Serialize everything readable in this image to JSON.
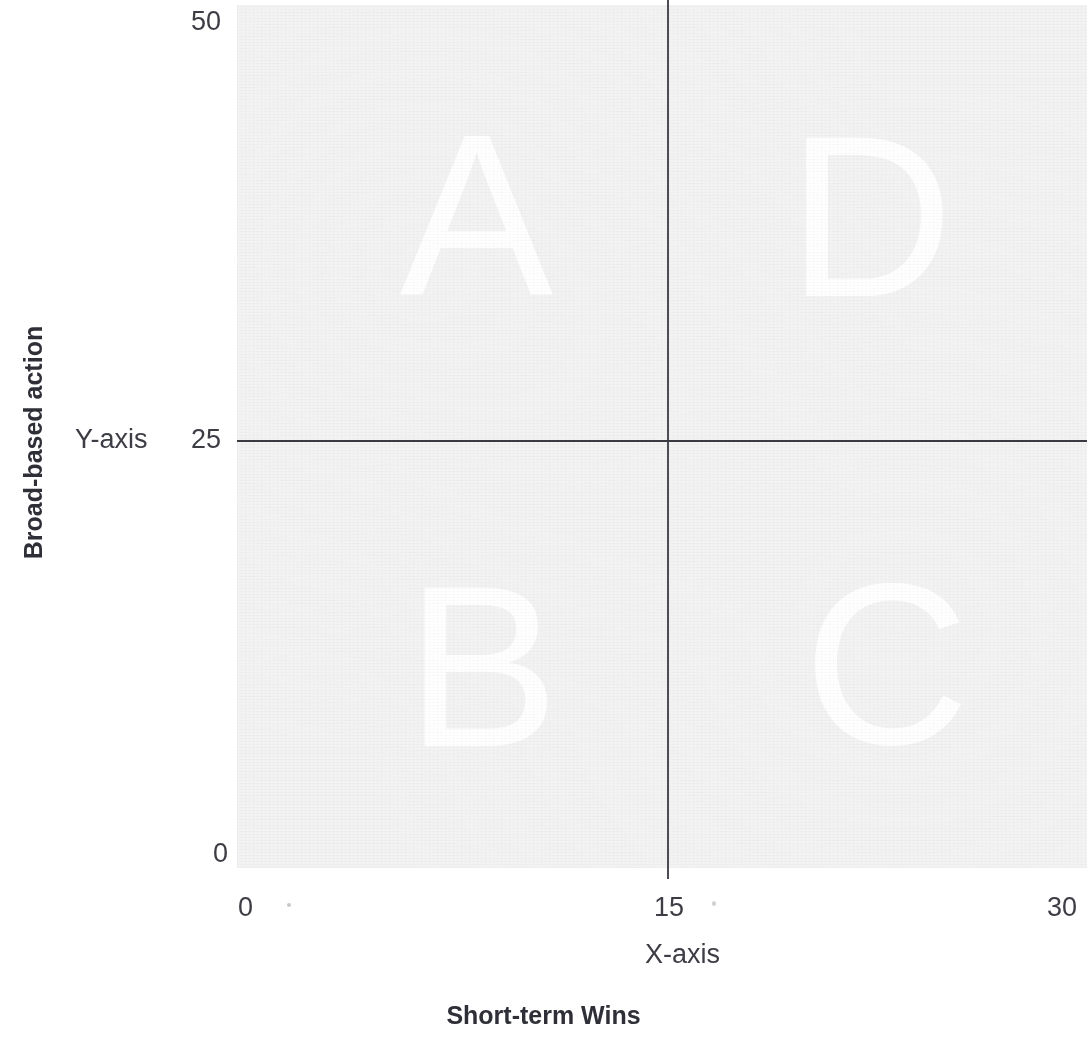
{
  "chart_data": {
    "type": "scatter",
    "title": "",
    "subtitle": "",
    "xlabel": "X-axis",
    "ylabel": "Y-axis",
    "x_outer_title": "Short-term Wins",
    "y_outer_title": "Broad-based action",
    "xlim": [
      0,
      30
    ],
    "ylim": [
      0,
      50
    ],
    "x_ticks": [
      "0",
      "15",
      "30"
    ],
    "y_ticks": [
      "0",
      "25",
      "50"
    ],
    "x_tick_values": [
      0,
      15,
      30
    ],
    "y_tick_values": [
      0,
      25,
      50
    ],
    "grid": false,
    "legend": null,
    "divider_x": 15,
    "divider_y": 25,
    "series": [],
    "quadrants": [
      {
        "id": "A",
        "label": "A",
        "x_range": [
          0,
          15
        ],
        "y_range": [
          25,
          50
        ],
        "position": "top-left"
      },
      {
        "id": "D",
        "label": "D",
        "x_range": [
          15,
          30
        ],
        "y_range": [
          25,
          50
        ],
        "position": "top-right"
      },
      {
        "id": "B",
        "label": "B",
        "x_range": [
          0,
          15
        ],
        "y_range": [
          0,
          25
        ],
        "position": "bottom-left"
      },
      {
        "id": "C",
        "label": "C",
        "x_range": [
          15,
          30
        ],
        "y_range": [
          0,
          25
        ],
        "position": "bottom-right"
      }
    ],
    "annotations": [],
    "colors": {
      "panel": "#f3f3f4",
      "axis_line": "#3a3a42",
      "divider_line": "#4c4c55",
      "quadrant_letter": "#ffffff",
      "text": "#3d3d46",
      "title_text": "#2f2f38",
      "background": "#ffffff"
    }
  },
  "axes": {
    "y": {
      "name": "Y-axis",
      "outer_title": "Broad-based action",
      "ticks": {
        "top": "50",
        "middle": "25",
        "bottom": "0"
      }
    },
    "x": {
      "name": "X-axis",
      "outer_title": "Short-term Wins",
      "ticks": {
        "left": "0",
        "middle": "15",
        "right": "30"
      }
    }
  },
  "quadrants": {
    "a": {
      "letter": "A"
    },
    "b": {
      "letter": "B"
    },
    "c": {
      "letter": "C"
    },
    "d": {
      "letter": "D"
    }
  }
}
